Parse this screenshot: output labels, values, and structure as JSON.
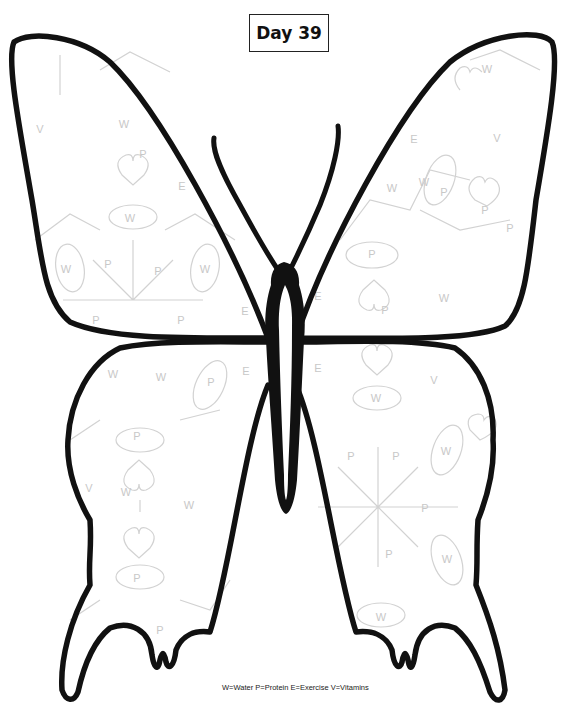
{
  "title": "Day 39",
  "legend": "W=Water P=Protein E=Exercise V=Vitamins",
  "legend_items": [
    {
      "key": "W",
      "meaning": "Water"
    },
    {
      "key": "P",
      "meaning": "Protein"
    },
    {
      "key": "E",
      "meaning": "Exercise"
    },
    {
      "key": "V",
      "meaning": "Vitamins"
    }
  ],
  "colors": {
    "outline": "#111111",
    "pattern": "#c8c8c8",
    "background": "#ffffff"
  },
  "pattern_letters": {
    "upper_left_wing": [
      {
        "t": "V",
        "x": 40,
        "y": 133
      },
      {
        "t": "W",
        "x": 124,
        "y": 128
      },
      {
        "t": "P",
        "x": 143,
        "y": 158
      },
      {
        "t": "E",
        "x": 182,
        "y": 190
      },
      {
        "t": "W",
        "x": 130,
        "y": 222
      },
      {
        "t": "W",
        "x": 66,
        "y": 273
      },
      {
        "t": "P",
        "x": 108,
        "y": 268
      },
      {
        "t": "P",
        "x": 158,
        "y": 275
      },
      {
        "t": "W",
        "x": 205,
        "y": 273
      },
      {
        "t": "P",
        "x": 96,
        "y": 324
      },
      {
        "t": "P",
        "x": 181,
        "y": 324
      },
      {
        "t": "E",
        "x": 245,
        "y": 315
      }
    ],
    "upper_right_wing": [
      {
        "t": "W",
        "x": 487,
        "y": 73
      },
      {
        "t": "E",
        "x": 414,
        "y": 143
      },
      {
        "t": "V",
        "x": 497,
        "y": 142
      },
      {
        "t": "W",
        "x": 392,
        "y": 192
      },
      {
        "t": "W",
        "x": 424,
        "y": 186
      },
      {
        "t": "P",
        "x": 444,
        "y": 196
      },
      {
        "t": "P",
        "x": 485,
        "y": 214
      },
      {
        "t": "P",
        "x": 510,
        "y": 232
      },
      {
        "t": "P",
        "x": 372,
        "y": 258
      },
      {
        "t": "E",
        "x": 318,
        "y": 300
      },
      {
        "t": "W",
        "x": 444,
        "y": 302
      },
      {
        "t": "P",
        "x": 385,
        "y": 314
      }
    ],
    "lower_left_wing": [
      {
        "t": "W",
        "x": 113,
        "y": 378
      },
      {
        "t": "W",
        "x": 161,
        "y": 381
      },
      {
        "t": "P",
        "x": 211,
        "y": 386
      },
      {
        "t": "E",
        "x": 246,
        "y": 375
      },
      {
        "t": "P",
        "x": 137,
        "y": 440
      },
      {
        "t": "V",
        "x": 89,
        "y": 492
      },
      {
        "t": "W",
        "x": 126,
        "y": 496
      },
      {
        "t": "W",
        "x": 189,
        "y": 509
      },
      {
        "t": "P",
        "x": 137,
        "y": 582
      },
      {
        "t": "P",
        "x": 160,
        "y": 634
      }
    ],
    "lower_right_wing": [
      {
        "t": "E",
        "x": 318,
        "y": 372
      },
      {
        "t": "W",
        "x": 376,
        "y": 402
      },
      {
        "t": "V",
        "x": 434,
        "y": 384
      },
      {
        "t": "W",
        "x": 446,
        "y": 455
      },
      {
        "t": "P",
        "x": 351,
        "y": 460
      },
      {
        "t": "P",
        "x": 396,
        "y": 460
      },
      {
        "t": "P",
        "x": 425,
        "y": 512
      },
      {
        "t": "P",
        "x": 389,
        "y": 558
      },
      {
        "t": "W",
        "x": 447,
        "y": 563
      },
      {
        "t": "W",
        "x": 381,
        "y": 621
      }
    ]
  }
}
